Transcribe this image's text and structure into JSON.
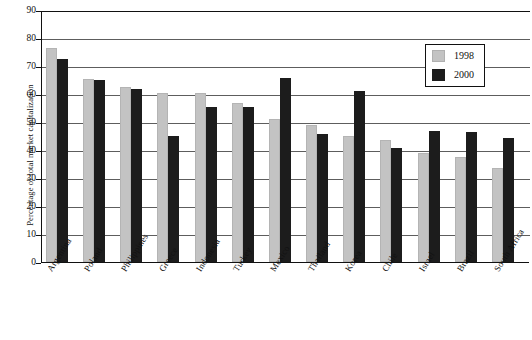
{
  "chart_data": {
    "type": "bar",
    "title": "",
    "xlabel": "",
    "ylabel": "Percentage of total market capitalization",
    "ylim": [
      0,
      90
    ],
    "ytick_step": 10,
    "yticks": [
      90,
      80,
      70,
      60,
      50,
      40,
      30,
      20,
      10,
      0
    ],
    "grid": true,
    "legend_position": "top-right",
    "categories": [
      "Argentina",
      "Poland",
      "Philippines",
      "Greece",
      "Indonesia",
      "Turkey",
      "Mexico",
      "Thailand",
      "Korea",
      "Chile",
      "Israel",
      "Brazil",
      "South Africa"
    ],
    "series": [
      {
        "name": "1998",
        "color": "#c3c3c3",
        "values": [
          76.3,
          65.5,
          62.5,
          60.5,
          60.5,
          56.7,
          51.0,
          49.0,
          45.0,
          43.5,
          38.8,
          37.4,
          33.5
        ]
      },
      {
        "name": "2000",
        "color": "#1c1c1c",
        "values": [
          72.6,
          65.0,
          61.8,
          45.0,
          55.4,
          55.3,
          65.8,
          45.8,
          61.0,
          40.8,
          46.7,
          46.5,
          44.3
        ]
      }
    ]
  },
  "legend": {
    "items": [
      {
        "label": "1998",
        "swatch": "light-gray-swatch"
      },
      {
        "label": "2000",
        "swatch": "black-swatch"
      }
    ]
  }
}
